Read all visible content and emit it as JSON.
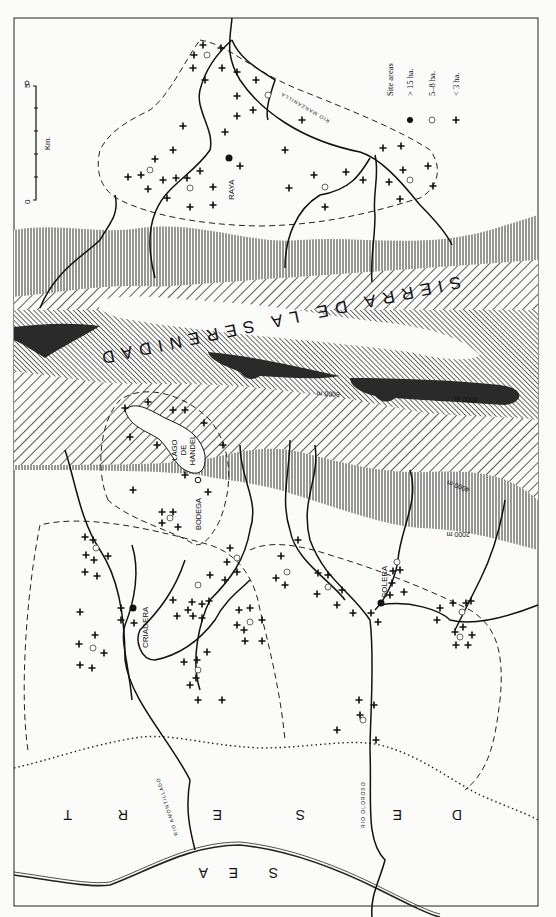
{
  "map": {
    "orientation": "rotated 180 degrees (printed upside-down)",
    "frame": {
      "x": 14,
      "y": 18,
      "width": 524,
      "height": 888
    },
    "colors": {
      "ink": "#111111",
      "paper": "#fbfbfa",
      "peak": "#2a2a2a"
    },
    "mountain_range": {
      "label": "SIERRA DE LA SERENIDAD"
    },
    "contours": [
      {
        "label": "2000 m"
      },
      {
        "label": "4000 m"
      },
      {
        "label": "6000 m"
      },
      {
        "label": "8000 m"
      }
    ],
    "lake": {
      "label_lines": [
        "LAGO",
        "DE",
        "HANDEL"
      ]
    },
    "settlements": [
      {
        "name": "RAYA",
        "size_class": "> 15 ha."
      },
      {
        "name": "BODEGA",
        "size_class": "5–8 ha."
      },
      {
        "name": "CRIADERA",
        "size_class": "> 15 ha."
      },
      {
        "name": "SOLERA",
        "size_class": "> 15 ha."
      }
    ],
    "rivers": [
      {
        "label": "RIO MANZANILLA"
      },
      {
        "label": "RIO AMONTILLADO"
      },
      {
        "label": "RIO OLOROSO"
      }
    ],
    "regions": {
      "desert": {
        "letters": [
          "D",
          "E",
          "S",
          "E",
          "R",
          "T"
        ]
      },
      "sea": {
        "letters": [
          "S",
          "E",
          "A"
        ]
      }
    },
    "scale_bar": {
      "unit": "Km.",
      "min": "0",
      "max": "5",
      "ticks": 5
    },
    "legend": {
      "title": "Site areas",
      "items": [
        {
          "symbol": "filled-circle",
          "label": "> 15 ha."
        },
        {
          "symbol": "open-circle",
          "label": "5–8 ha."
        },
        {
          "symbol": "cross",
          "label": "< 3 ha."
        }
      ]
    }
  }
}
